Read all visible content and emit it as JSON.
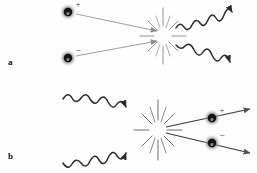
{
  "figure": {
    "background_color": "#fdfdfd",
    "particle_line_color": "#9a9a9a",
    "photon_line_color": "#2b2b2b",
    "starburst_color": "#7d7d7d",
    "particle_core_color": "#1a1a1a",
    "particle_glow_color": "#b5b5b5",
    "label_color": "#111111"
  },
  "panels": [
    {
      "id": "a",
      "label": "a",
      "description": "Electron and positron annihilate into two photons",
      "incoming": [
        {
          "name": "positron",
          "symbol": "e",
          "charge": "+",
          "type": "particle",
          "direction": "down-right"
        },
        {
          "name": "electron",
          "symbol": "e",
          "charge": "−",
          "type": "particle",
          "direction": "up-right"
        }
      ],
      "outgoing": [
        {
          "name": "photon-upper",
          "symbol": "",
          "type": "photon",
          "direction": "up-right"
        },
        {
          "name": "photon-lower",
          "symbol": "",
          "type": "photon",
          "direction": "down-right"
        }
      ],
      "vertex": {
        "x": 163,
        "y": 36
      }
    },
    {
      "id": "b",
      "label": "b",
      "description": "Two photons collide producing an electron-positron pair",
      "incoming": [
        {
          "name": "photon-upper",
          "symbol": "",
          "type": "photon",
          "direction": "down-right"
        },
        {
          "name": "photon-lower",
          "symbol": "",
          "type": "photon",
          "direction": "up-right"
        }
      ],
      "outgoing": [
        {
          "name": "positron",
          "symbol": "e",
          "charge": "+",
          "type": "particle",
          "direction": "up-right"
        },
        {
          "name": "electron",
          "symbol": "e",
          "charge": "−",
          "type": "particle",
          "direction": "down-right"
        }
      ],
      "vertex": {
        "x": 158,
        "y": 130
      }
    }
  ],
  "symbols": {
    "electron_letter": "e",
    "plus": "+",
    "minus": "−"
  }
}
